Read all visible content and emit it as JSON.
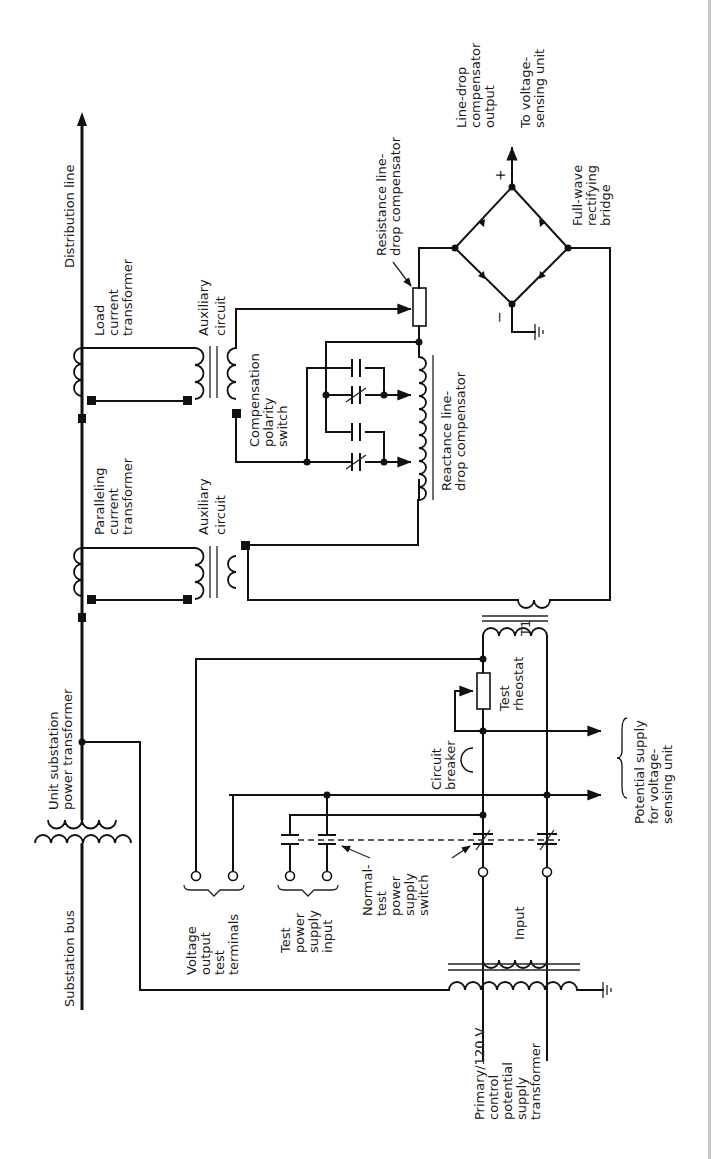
{
  "diagram": {
    "orientation": "rotated 90 degrees counter-clockwise",
    "labels": {
      "distribution_line": "Distribution line",
      "substation_bus": "Substation bus",
      "unit_substation_1": "Unit substation",
      "unit_substation_2": "power transformer",
      "load_ct_1": "Load",
      "load_ct_2": "current",
      "load_ct_3": "transformer",
      "paralleling_ct_1": "Paralleling",
      "paralleling_ct_2": "current",
      "paralleling_ct_3": "transformer",
      "aux_circuit_top_1": "Auxiliary",
      "aux_circuit_top_2": "circuit",
      "aux_circuit_bottom_1": "Auxiliary",
      "aux_circuit_bottom_2": "circuit",
      "comp_polarity_1": "Compensation",
      "comp_polarity_2": "polarity",
      "comp_polarity_3": "switch",
      "reactance_comp_1": "Reactance line-",
      "reactance_comp_2": "drop compensator",
      "resistance_comp_1": "Resistance line-",
      "resistance_comp_2": "drop compensator",
      "ldc_output_1": "Line-drop",
      "ldc_output_2": "compensator",
      "ldc_output_3": "output",
      "to_vsu_1": "To voltage-",
      "to_vsu_2": "sensing unit",
      "bridge_1": "Full-wave",
      "bridge_2": "rectifying",
      "bridge_3": "bridge",
      "plus": "+",
      "minus": "−",
      "t1": "T1",
      "test_rheostat_1": "Test",
      "test_rheostat_2": "rheostat",
      "circuit_breaker_1": "Circuit",
      "circuit_breaker_2": "breaker",
      "potential_supply_1": "Potential supply",
      "potential_supply_2": "for voltage-",
      "potential_supply_3": "sensing unit",
      "voltage_output_1": "Voltage",
      "voltage_output_2": "output",
      "voltage_output_3": "test",
      "voltage_output_4": "terminals",
      "test_power_1": "Test",
      "test_power_2": "power",
      "test_power_3": "supply",
      "test_power_4": "input",
      "normal_test_1": "Normal-",
      "normal_test_2": "test",
      "normal_test_3": "power",
      "normal_test_4": "supply",
      "normal_test_5": "switch",
      "input": "Input",
      "primary_1": "Primary/120 V",
      "primary_2": "control",
      "primary_3": "potential",
      "primary_4": "supply",
      "primary_5": "transformer"
    }
  }
}
